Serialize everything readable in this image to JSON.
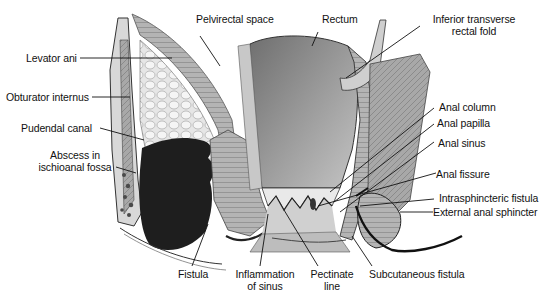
{
  "figure": {
    "colors": {
      "background": "#ffffff",
      "label_text": "#111111",
      "leader_line": "#111111",
      "rectum_wall": "#8a8a8a",
      "rectum_light": "#bdbdbd",
      "abscess": "#1e1e1e",
      "fat": "#e2e2e2",
      "muscle": "#a9a9a9"
    }
  },
  "labels": {
    "pelvirectal_space": "Pelvirectal space",
    "rectum": "Rectum",
    "inferior_transverse_1": "Inferior transverse",
    "inferior_transverse_2": "rectal fold",
    "levator_ani": "Levator ani",
    "obturator_internus": "Obturator internus",
    "pudendal_canal": "Pudendal canal",
    "abscess_1": "Abscess in",
    "abscess_2": "ischioanal fossa",
    "anal_column": "Anal column",
    "anal_papilla": "Anal papilla",
    "anal_sinus": "Anal sinus",
    "anal_fissure": "Anal fissure",
    "intrasphincteric_fistula": "Intrasphincteric fistula",
    "external_anal_sphincter": "External anal sphincter",
    "fistula": "Fistula",
    "inflammation_1": "Inflammation",
    "inflammation_2": "of sinus",
    "pectinate_1": "Pectinate",
    "pectinate_2": "line",
    "subcutaneous_fistula": "Subcutaneous fistula"
  }
}
